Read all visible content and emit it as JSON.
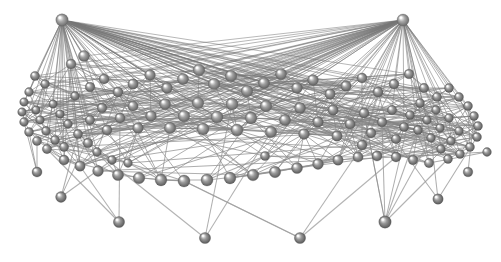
{
  "figure": {
    "background_color": "#ffffff",
    "width": 501,
    "height": 262,
    "node_color": "#8e8e8e",
    "node_highlight_color": "#e8e8e8",
    "node_shadow_color": "#5a5a5a",
    "edge_color": "#888888",
    "edge_color_light": "#b9b9b9",
    "edge_color_dark": "#6b6b6b"
  },
  "chart_data": {
    "type": "scatter",
    "xlabel": "",
    "ylabel": "",
    "grid": false,
    "legend": "none",
    "node_count": 118,
    "edge_count": 612,
    "nodes": [
      {
        "id": 0,
        "x": 62,
        "y": 20,
        "r": 6.2,
        "shade": 1.0
      },
      {
        "id": 1,
        "x": 403,
        "y": 20,
        "r": 6.0,
        "shade": 1.0
      },
      {
        "id": 2,
        "x": 84,
        "y": 56,
        "r": 5.6,
        "shade": 0.86
      },
      {
        "id": 3,
        "x": 71,
        "y": 64,
        "r": 5.0,
        "shade": 0.8
      },
      {
        "id": 4,
        "x": 35,
        "y": 76,
        "r": 4.6,
        "shade": 0.72
      },
      {
        "id": 5,
        "x": 45,
        "y": 84,
        "r": 4.4,
        "shade": 0.7
      },
      {
        "id": 6,
        "x": 29,
        "y": 92,
        "r": 4.4,
        "shade": 0.7
      },
      {
        "id": 7,
        "x": 24,
        "y": 102,
        "r": 4.3,
        "shade": 0.68
      },
      {
        "id": 8,
        "x": 22,
        "y": 112,
        "r": 4.3,
        "shade": 0.68
      },
      {
        "id": 9,
        "x": 24,
        "y": 122,
        "r": 4.4,
        "shade": 0.69
      },
      {
        "id": 10,
        "x": 29,
        "y": 132,
        "r": 4.5,
        "shade": 0.7
      },
      {
        "id": 11,
        "x": 37,
        "y": 141,
        "r": 4.6,
        "shade": 0.71
      },
      {
        "id": 12,
        "x": 47,
        "y": 149,
        "r": 4.7,
        "shade": 0.72
      },
      {
        "id": 13,
        "x": 36,
        "y": 110,
        "r": 4.2,
        "shade": 0.66
      },
      {
        "id": 14,
        "x": 40,
        "y": 120,
        "r": 4.3,
        "shade": 0.67
      },
      {
        "id": 15,
        "x": 46,
        "y": 131,
        "r": 4.4,
        "shade": 0.68
      },
      {
        "id": 16,
        "x": 55,
        "y": 140,
        "r": 4.5,
        "shade": 0.7
      },
      {
        "id": 17,
        "x": 64,
        "y": 147,
        "r": 4.6,
        "shade": 0.71
      },
      {
        "id": 18,
        "x": 53,
        "y": 104,
        "r": 4.2,
        "shade": 0.66
      },
      {
        "id": 19,
        "x": 60,
        "y": 114,
        "r": 4.3,
        "shade": 0.67
      },
      {
        "id": 20,
        "x": 68,
        "y": 124,
        "r": 4.4,
        "shade": 0.69
      },
      {
        "id": 21,
        "x": 78,
        "y": 134,
        "r": 4.6,
        "shade": 0.7
      },
      {
        "id": 22,
        "x": 88,
        "y": 143,
        "r": 4.8,
        "shade": 0.72
      },
      {
        "id": 23,
        "x": 75,
        "y": 96,
        "r": 4.4,
        "shade": 0.68
      },
      {
        "id": 24,
        "x": 90,
        "y": 87,
        "r": 4.8,
        "shade": 0.74
      },
      {
        "id": 25,
        "x": 104,
        "y": 79,
        "r": 5.0,
        "shade": 0.78
      },
      {
        "id": 26,
        "x": 118,
        "y": 92,
        "r": 5.0,
        "shade": 0.76
      },
      {
        "id": 27,
        "x": 133,
        "y": 84,
        "r": 5.2,
        "shade": 0.8
      },
      {
        "id": 28,
        "x": 150,
        "y": 75,
        "r": 5.4,
        "shade": 0.84
      },
      {
        "id": 29,
        "x": 167,
        "y": 88,
        "r": 5.4,
        "shade": 0.82
      },
      {
        "id": 30,
        "x": 183,
        "y": 79,
        "r": 5.6,
        "shade": 0.86
      },
      {
        "id": 31,
        "x": 199,
        "y": 70,
        "r": 5.8,
        "shade": 0.9
      },
      {
        "id": 32,
        "x": 214,
        "y": 84,
        "r": 5.8,
        "shade": 0.88
      },
      {
        "id": 33,
        "x": 231,
        "y": 76,
        "r": 5.8,
        "shade": 0.88
      },
      {
        "id": 34,
        "x": 247,
        "y": 91,
        "r": 5.8,
        "shade": 0.86
      },
      {
        "id": 35,
        "x": 264,
        "y": 83,
        "r": 5.6,
        "shade": 0.85
      },
      {
        "id": 36,
        "x": 281,
        "y": 74,
        "r": 5.6,
        "shade": 0.86
      },
      {
        "id": 37,
        "x": 297,
        "y": 88,
        "r": 5.4,
        "shade": 0.83
      },
      {
        "id": 38,
        "x": 313,
        "y": 80,
        "r": 5.4,
        "shade": 0.83
      },
      {
        "id": 39,
        "x": 330,
        "y": 94,
        "r": 5.2,
        "shade": 0.8
      },
      {
        "id": 40,
        "x": 346,
        "y": 86,
        "r": 5.2,
        "shade": 0.8
      },
      {
        "id": 41,
        "x": 362,
        "y": 78,
        "r": 5.0,
        "shade": 0.79
      },
      {
        "id": 42,
        "x": 378,
        "y": 92,
        "r": 5.0,
        "shade": 0.77
      },
      {
        "id": 43,
        "x": 394,
        "y": 84,
        "r": 4.9,
        "shade": 0.76
      },
      {
        "id": 44,
        "x": 409,
        "y": 74,
        "r": 4.8,
        "shade": 0.76
      },
      {
        "id": 45,
        "x": 424,
        "y": 88,
        "r": 4.7,
        "shade": 0.73
      },
      {
        "id": 46,
        "x": 437,
        "y": 97,
        "r": 4.6,
        "shade": 0.72
      },
      {
        "id": 47,
        "x": 449,
        "y": 88,
        "r": 4.5,
        "shade": 0.72
      },
      {
        "id": 48,
        "x": 459,
        "y": 97,
        "r": 4.5,
        "shade": 0.71
      },
      {
        "id": 49,
        "x": 468,
        "y": 106,
        "r": 4.5,
        "shade": 0.71
      },
      {
        "id": 50,
        "x": 474,
        "y": 116,
        "r": 4.5,
        "shade": 0.71
      },
      {
        "id": 51,
        "x": 478,
        "y": 126,
        "r": 4.5,
        "shade": 0.71
      },
      {
        "id": 52,
        "x": 477,
        "y": 137,
        "r": 4.5,
        "shade": 0.7
      },
      {
        "id": 53,
        "x": 470,
        "y": 147,
        "r": 4.5,
        "shade": 0.7
      },
      {
        "id": 54,
        "x": 460,
        "y": 154,
        "r": 4.5,
        "shade": 0.7
      },
      {
        "id": 55,
        "x": 448,
        "y": 159,
        "r": 4.5,
        "shade": 0.7
      },
      {
        "id": 56,
        "x": 459,
        "y": 131,
        "r": 4.4,
        "shade": 0.69
      },
      {
        "id": 57,
        "x": 451,
        "y": 141,
        "r": 4.4,
        "shade": 0.69
      },
      {
        "id": 58,
        "x": 441,
        "y": 149,
        "r": 4.4,
        "shade": 0.69
      },
      {
        "id": 59,
        "x": 449,
        "y": 118,
        "r": 4.4,
        "shade": 0.7
      },
      {
        "id": 60,
        "x": 440,
        "y": 128,
        "r": 4.4,
        "shade": 0.69
      },
      {
        "id": 61,
        "x": 431,
        "y": 138,
        "r": 4.4,
        "shade": 0.69
      },
      {
        "id": 62,
        "x": 436,
        "y": 110,
        "r": 4.4,
        "shade": 0.7
      },
      {
        "id": 63,
        "x": 427,
        "y": 120,
        "r": 4.4,
        "shade": 0.69
      },
      {
        "id": 64,
        "x": 418,
        "y": 130,
        "r": 4.5,
        "shade": 0.69
      },
      {
        "id": 65,
        "x": 420,
        "y": 103,
        "r": 4.5,
        "shade": 0.71
      },
      {
        "id": 66,
        "x": 410,
        "y": 115,
        "r": 4.5,
        "shade": 0.7
      },
      {
        "id": 67,
        "x": 404,
        "y": 127,
        "r": 4.6,
        "shade": 0.7
      },
      {
        "id": 68,
        "x": 396,
        "y": 139,
        "r": 4.7,
        "shade": 0.71
      },
      {
        "id": 69,
        "x": 392,
        "y": 110,
        "r": 4.7,
        "shade": 0.73
      },
      {
        "id": 70,
        "x": 382,
        "y": 122,
        "r": 4.8,
        "shade": 0.73
      },
      {
        "id": 71,
        "x": 371,
        "y": 133,
        "r": 4.9,
        "shade": 0.73
      },
      {
        "id": 72,
        "x": 362,
        "y": 145,
        "r": 5.0,
        "shade": 0.73
      },
      {
        "id": 73,
        "x": 364,
        "y": 113,
        "r": 5.0,
        "shade": 0.76
      },
      {
        "id": 74,
        "x": 350,
        "y": 124,
        "r": 5.1,
        "shade": 0.76
      },
      {
        "id": 75,
        "x": 337,
        "y": 136,
        "r": 5.2,
        "shade": 0.76
      },
      {
        "id": 76,
        "x": 333,
        "y": 110,
        "r": 5.2,
        "shade": 0.78
      },
      {
        "id": 77,
        "x": 318,
        "y": 122,
        "r": 5.3,
        "shade": 0.78
      },
      {
        "id": 78,
        "x": 304,
        "y": 134,
        "r": 5.4,
        "shade": 0.78
      },
      {
        "id": 79,
        "x": 300,
        "y": 108,
        "r": 5.5,
        "shade": 0.82
      },
      {
        "id": 80,
        "x": 285,
        "y": 120,
        "r": 5.6,
        "shade": 0.82
      },
      {
        "id": 81,
        "x": 271,
        "y": 132,
        "r": 5.7,
        "shade": 0.82
      },
      {
        "id": 82,
        "x": 266,
        "y": 106,
        "r": 5.8,
        "shade": 0.86
      },
      {
        "id": 83,
        "x": 251,
        "y": 118,
        "r": 5.9,
        "shade": 0.86
      },
      {
        "id": 84,
        "x": 237,
        "y": 130,
        "r": 6.0,
        "shade": 0.86
      },
      {
        "id": 85,
        "x": 232,
        "y": 104,
        "r": 6.0,
        "shade": 0.9
      },
      {
        "id": 86,
        "x": 217,
        "y": 117,
        "r": 6.0,
        "shade": 0.9
      },
      {
        "id": 87,
        "x": 203,
        "y": 129,
        "r": 6.0,
        "shade": 0.89
      },
      {
        "id": 88,
        "x": 198,
        "y": 103,
        "r": 5.8,
        "shade": 0.89
      },
      {
        "id": 89,
        "x": 184,
        "y": 116,
        "r": 5.8,
        "shade": 0.88
      },
      {
        "id": 90,
        "x": 170,
        "y": 128,
        "r": 5.7,
        "shade": 0.86
      },
      {
        "id": 91,
        "x": 165,
        "y": 104,
        "r": 5.5,
        "shade": 0.86
      },
      {
        "id": 92,
        "x": 151,
        "y": 116,
        "r": 5.4,
        "shade": 0.84
      },
      {
        "id": 93,
        "x": 138,
        "y": 128,
        "r": 5.3,
        "shade": 0.82
      },
      {
        "id": 94,
        "x": 133,
        "y": 106,
        "r": 5.1,
        "shade": 0.82
      },
      {
        "id": 95,
        "x": 120,
        "y": 118,
        "r": 5.0,
        "shade": 0.8
      },
      {
        "id": 96,
        "x": 107,
        "y": 130,
        "r": 5.0,
        "shade": 0.78
      },
      {
        "id": 97,
        "x": 102,
        "y": 108,
        "r": 4.8,
        "shade": 0.77
      },
      {
        "id": 98,
        "x": 90,
        "y": 120,
        "r": 4.7,
        "shade": 0.75
      },
      {
        "id": 99,
        "x": 64,
        "y": 160,
        "r": 5.0,
        "shade": 0.72
      },
      {
        "id": 100,
        "x": 80,
        "y": 166,
        "r": 5.2,
        "shade": 0.73
      },
      {
        "id": 101,
        "x": 98,
        "y": 171,
        "r": 5.4,
        "shade": 0.74
      },
      {
        "id": 102,
        "x": 118,
        "y": 175,
        "r": 5.6,
        "shade": 0.75
      },
      {
        "id": 103,
        "x": 139,
        "y": 178,
        "r": 5.8,
        "shade": 0.76
      },
      {
        "id": 104,
        "x": 161,
        "y": 180,
        "r": 5.9,
        "shade": 0.76
      },
      {
        "id": 105,
        "x": 184,
        "y": 181,
        "r": 6.0,
        "shade": 0.76
      },
      {
        "id": 106,
        "x": 207,
        "y": 180,
        "r": 6.0,
        "shade": 0.76
      },
      {
        "id": 107,
        "x": 230,
        "y": 178,
        "r": 5.9,
        "shade": 0.76
      },
      {
        "id": 108,
        "x": 253,
        "y": 175,
        "r": 5.8,
        "shade": 0.75
      },
      {
        "id": 109,
        "x": 275,
        "y": 172,
        "r": 5.7,
        "shade": 0.75
      },
      {
        "id": 110,
        "x": 297,
        "y": 168,
        "r": 5.5,
        "shade": 0.74
      },
      {
        "id": 111,
        "x": 318,
        "y": 164,
        "r": 5.4,
        "shade": 0.74
      },
      {
        "id": 112,
        "x": 338,
        "y": 160,
        "r": 5.2,
        "shade": 0.73
      },
      {
        "id": 113,
        "x": 358,
        "y": 157,
        "r": 5.1,
        "shade": 0.73
      },
      {
        "id": 114,
        "x": 377,
        "y": 156,
        "r": 5.0,
        "shade": 0.72
      },
      {
        "id": 115,
        "x": 396,
        "y": 157,
        "r": 4.9,
        "shade": 0.72
      },
      {
        "id": 116,
        "x": 413,
        "y": 160,
        "r": 4.8,
        "shade": 0.71
      },
      {
        "id": 117,
        "x": 429,
        "y": 163,
        "r": 4.7,
        "shade": 0.71
      },
      {
        "id": 118,
        "x": 37,
        "y": 172,
        "r": 5.0,
        "shade": 0.7
      },
      {
        "id": 119,
        "x": 61,
        "y": 197,
        "r": 5.4,
        "shade": 0.7
      },
      {
        "id": 120,
        "x": 119,
        "y": 222,
        "r": 5.6,
        "shade": 0.7
      },
      {
        "id": 121,
        "x": 205,
        "y": 238,
        "r": 5.6,
        "shade": 0.7
      },
      {
        "id": 122,
        "x": 300,
        "y": 238,
        "r": 5.6,
        "shade": 0.7
      },
      {
        "id": 123,
        "x": 385,
        "y": 222,
        "r": 6.2,
        "shade": 0.7
      },
      {
        "id": 124,
        "x": 438,
        "y": 199,
        "r": 5.2,
        "shade": 0.7
      },
      {
        "id": 125,
        "x": 468,
        "y": 172,
        "r": 4.8,
        "shade": 0.7
      },
      {
        "id": 126,
        "x": 487,
        "y": 152,
        "r": 4.4,
        "shade": 0.7
      },
      {
        "id": 127,
        "x": 112,
        "y": 160,
        "r": 4.4,
        "shade": 0.72
      },
      {
        "id": 128,
        "x": 97,
        "y": 152,
        "r": 4.4,
        "shade": 0.72
      },
      {
        "id": 129,
        "x": 128,
        "y": 163,
        "r": 4.4,
        "shade": 0.73
      },
      {
        "id": 130,
        "x": 265,
        "y": 156,
        "r": 4.6,
        "shade": 0.74
      }
    ],
    "apex_nodes": [
      0,
      1
    ],
    "pendant_nodes": [
      118,
      119,
      120,
      121,
      122,
      123,
      124,
      125,
      126
    ],
    "edge_seed": 20240517,
    "edge_density_note": "Core nodes are densely interconnected (roughly 10 edges per node); apex nodes 0 and 1 each fan out to dozens of core nodes; pendant nodes connect by 1-6 long thin edges up into the lower rim."
  }
}
